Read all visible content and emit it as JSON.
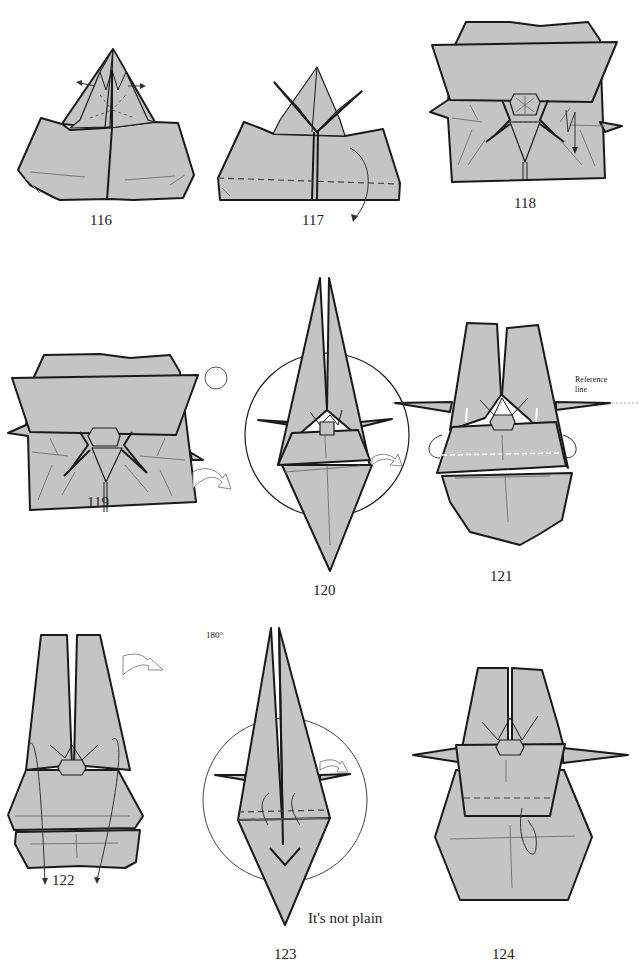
{
  "page": {
    "type": "origami instruction diagrams",
    "background": "#ffffff",
    "paper_color": "#c4c4c4",
    "line_color": "#1a1a1a"
  },
  "steps": [
    {
      "number": "116",
      "symbols": [
        "spread-arrows"
      ]
    },
    {
      "number": "117",
      "symbols": [
        "valley-fold-line",
        "fold-behind-arrow"
      ]
    },
    {
      "number": "118",
      "symbols": [
        "pleat-arrow"
      ]
    },
    {
      "number": "119",
      "symbols": [
        "rotate-180-symbol",
        "turn-over-arrow"
      ],
      "rotate_label": "180°"
    },
    {
      "number": "120",
      "symbols": [
        "view-circle",
        "turn-over-arrow"
      ]
    },
    {
      "number": "121",
      "symbols": [
        "reference-line",
        "fold-behind-arrows"
      ],
      "reference_label": "Reference",
      "reference_label_2": "line"
    },
    {
      "number": "122",
      "symbols": [
        "turn-over-arrow",
        "fold-down-arrows"
      ]
    },
    {
      "number": "123",
      "symbols": [
        "view-circle",
        "turn-over-arrow",
        "fold-up-arrows"
      ],
      "note": "It's not plain"
    },
    {
      "number": "124",
      "symbols": [
        "valley-fold-line",
        "tuck-arrow"
      ]
    }
  ]
}
